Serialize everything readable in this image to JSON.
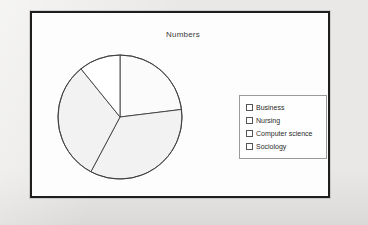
{
  "slide": {
    "title": "Numbers"
  },
  "legend": {
    "items": [
      {
        "label": "Business",
        "marker": "checkbox-square"
      },
      {
        "label": "Nursing",
        "marker": "checkbox-square"
      },
      {
        "label": "Computer science",
        "marker": "checkbox-square"
      },
      {
        "label": "Sociology",
        "marker": "checkbox-square"
      }
    ]
  },
  "chart_data": {
    "type": "pie",
    "title": "Numbers",
    "categories": [
      "Business",
      "Nursing",
      "Computer science",
      "Sociology"
    ],
    "values": [
      23,
      35,
      31,
      11
    ],
    "start_angle_deg": 0,
    "boundary_angles_deg": [
      0,
      83,
      208,
      321
    ],
    "slice_colors": [
      "#fbfbfb",
      "#f2f2f2",
      "#f2f2f2",
      "#ffffff"
    ],
    "outline_color": "#3d3d3d",
    "legend_position": "right",
    "grid": false,
    "xlabel": "",
    "ylabel": ""
  }
}
